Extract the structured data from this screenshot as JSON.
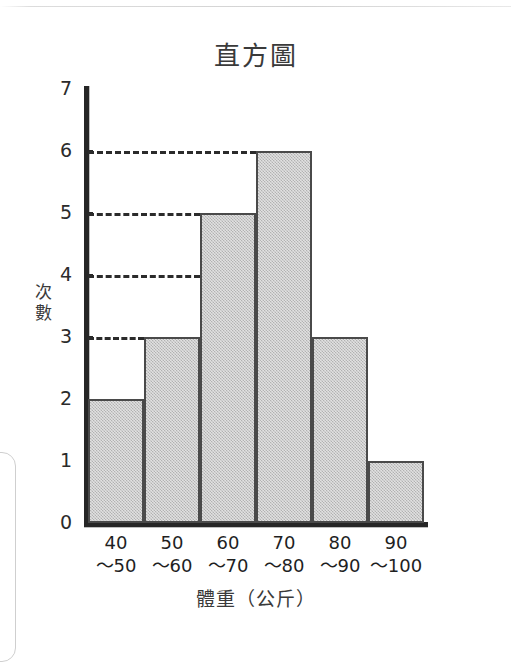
{
  "chart_data": {
    "type": "bar",
    "title": "直方圖",
    "xlabel": "體重（公斤）",
    "ylabel": "次數",
    "ylabel_chars": [
      "次",
      "數"
    ],
    "categories": [
      "40〜50",
      "50〜60",
      "60〜70",
      "70〜80",
      "80〜90",
      "90〜100"
    ],
    "category_parts": [
      {
        "lo": "40",
        "hi": "〜50"
      },
      {
        "lo": "50",
        "hi": "〜60"
      },
      {
        "lo": "60",
        "hi": "〜70"
      },
      {
        "lo": "70",
        "hi": "〜80"
      },
      {
        "lo": "80",
        "hi": "〜90"
      },
      {
        "lo": "90",
        "hi": "〜100"
      }
    ],
    "values": [
      2,
      3,
      5,
      6,
      3,
      1
    ],
    "ylim": [
      0,
      7
    ],
    "ytick_labels": [
      "0",
      "1",
      "2",
      "3",
      "4",
      "5",
      "6",
      "7"
    ],
    "yticks": [
      0,
      1,
      2,
      3,
      4,
      5,
      6,
      7
    ],
    "gridlines": [
      {
        "value": 6,
        "extends_to_bar_index": 3
      },
      {
        "value": 5,
        "extends_to_bar_index": 2
      },
      {
        "value": 4,
        "extends_to_bar_index": 2
      },
      {
        "value": 3,
        "extends_to_bar_index": 1
      }
    ],
    "grid": "dashed-partial",
    "legend": "none",
    "colors": {
      "bar_fill": "#c9c9c9",
      "bar_stroke": "#4a4a4a",
      "axis": "#262626",
      "text": "#2b2b2b",
      "background": "#ffffff"
    }
  }
}
